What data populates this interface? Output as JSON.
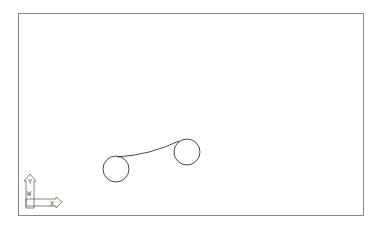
{
  "drawing": {
    "frame": {
      "x": 18,
      "y": 13,
      "width": 345,
      "height": 202,
      "stroke": "#777777"
    },
    "entities": [
      {
        "type": "circle",
        "cx": 116,
        "cy": 169,
        "r": 13
      },
      {
        "type": "circle",
        "cx": 187,
        "cy": 152,
        "r": 13
      },
      {
        "type": "arc",
        "from": [
          117,
          157
        ],
        "to": [
          178,
          141
        ]
      }
    ],
    "line_color": "#333333"
  },
  "ucs_icon": {
    "y_label": "Y",
    "w_label": "W",
    "x_label": "X"
  }
}
